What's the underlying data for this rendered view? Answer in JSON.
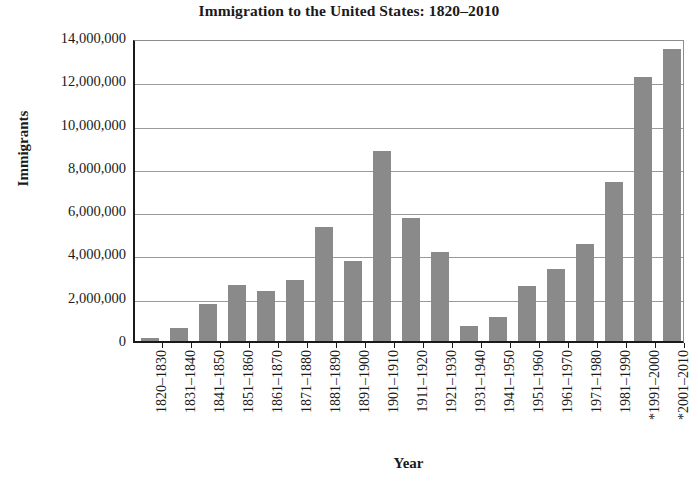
{
  "chart_data": {
    "type": "bar",
    "title": "Immigration to the United States: 1820–2010",
    "xlabel": "Year",
    "ylabel": "Immigrants",
    "categories": [
      "1820–1830",
      "1831–1840",
      "1841–1850",
      "1851–1860",
      "1861–1870",
      "1871–1880",
      "1881–1890",
      "1891–1900",
      "1901–1910",
      "1911–1920",
      "1921–1930",
      "1931–1940",
      "1941–1950",
      "1951–1960",
      "1961–1970",
      "1971–1980",
      "1981–1990",
      "*1991–2000",
      "*2001–2010"
    ],
    "values": [
      150000,
      600000,
      1700000,
      2600000,
      2300000,
      2800000,
      5250000,
      3700000,
      8800000,
      5700000,
      4100000,
      700000,
      1100000,
      2550000,
      3350000,
      4500000,
      7350000,
      12200000,
      13500000
    ],
    "ylim": [
      0,
      14000000
    ],
    "ytick_values": [
      0,
      2000000,
      4000000,
      6000000,
      8000000,
      10000000,
      12000000,
      14000000
    ],
    "ytick_labels": [
      "0",
      "2,000,000",
      "4,000,000",
      "6,000,000",
      "8,000,000",
      "10,000,000",
      "12,000,000",
      "14,000,000"
    ],
    "grid": true,
    "legend": false,
    "bar_color": "#8a8a8a",
    "axis_color": "#1a1a1a",
    "gridline_color": "#9a9a9a",
    "background_color": "#ffffff"
  }
}
